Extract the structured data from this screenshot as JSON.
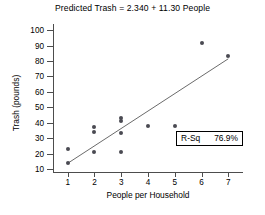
{
  "chart_data": {
    "type": "scatter",
    "title": "Predicted Trash = 2.340 + 11.30 People",
    "xlabel": "People per Household",
    "ylabel": "Trash (pounds)",
    "xlim": [
      0.45,
      7.55
    ],
    "ylim": [
      8,
      104
    ],
    "xticks": [
      1,
      2,
      3,
      4,
      5,
      6,
      7
    ],
    "yticks": [
      10,
      20,
      30,
      40,
      50,
      60,
      70,
      80,
      90,
      100
    ],
    "xtick_labels": [
      "1",
      "2",
      "3",
      "4",
      "5",
      "6",
      "7"
    ],
    "ytick_labels": [
      "10",
      "20",
      "30",
      "40",
      "50",
      "60",
      "70",
      "80",
      "90",
      "100"
    ],
    "grid": false,
    "legend_position": "bottom-right",
    "point_color": "#4a4a52",
    "line_color": "#6b6b6b",
    "axis_color": "#4d4d4d",
    "points": [
      {
        "x": 1,
        "y": 14
      },
      {
        "x": 1,
        "y": 23
      },
      {
        "x": 2,
        "y": 21
      },
      {
        "x": 2,
        "y": 34
      },
      {
        "x": 2,
        "y": 37
      },
      {
        "x": 3,
        "y": 21
      },
      {
        "x": 3,
        "y": 33
      },
      {
        "x": 3,
        "y": 41
      },
      {
        "x": 3,
        "y": 43
      },
      {
        "x": 4,
        "y": 38
      },
      {
        "x": 5,
        "y": 38
      },
      {
        "x": 6,
        "y": 92
      },
      {
        "x": 7,
        "y": 83
      }
    ],
    "fit_line": {
      "intercept": 2.34,
      "slope": 11.3,
      "x_start": 1,
      "x_end": 7,
      "y_start": 13.64,
      "y_end": 81.44
    },
    "annotation": {
      "rsq_label": "R-Sq",
      "rsq_value": "76.9%"
    }
  }
}
